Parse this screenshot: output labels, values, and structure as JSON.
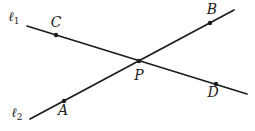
{
  "diagram": {
    "background": "#ffffff",
    "ink": "#1c1c1c",
    "lines": [
      {
        "name": "line-1",
        "label": "ℓ",
        "label_sub": "1",
        "x1": 27,
        "y1": 26,
        "x2": 247,
        "y2": 94,
        "label_pos": {
          "x": 14,
          "y": 16
        }
      },
      {
        "name": "line-2",
        "label": "ℓ",
        "label_sub": "2",
        "x1": 30,
        "y1": 119,
        "x2": 234,
        "y2": 10,
        "label_pos": {
          "x": 17,
          "y": 112
        }
      }
    ],
    "points": [
      {
        "label": "C",
        "x": 56,
        "y": 35,
        "label_pos": {
          "x": 56,
          "y": 22
        }
      },
      {
        "label": "B",
        "x": 210,
        "y": 23,
        "label_pos": {
          "x": 212,
          "y": 9
        }
      },
      {
        "label": "P",
        "x": 139,
        "y": 61,
        "label_pos": {
          "x": 139,
          "y": 75
        }
      },
      {
        "label": "A",
        "x": 64,
        "y": 101,
        "label_pos": {
          "x": 63,
          "y": 110
        }
      },
      {
        "label": "D",
        "x": 216,
        "y": 84,
        "label_pos": {
          "x": 213,
          "y": 92
        }
      }
    ]
  }
}
